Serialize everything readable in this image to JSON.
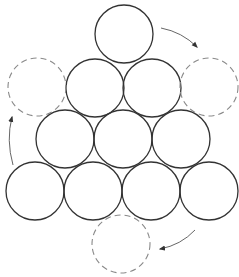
{
  "diagram": {
    "width": 239,
    "height": 277,
    "radius": 29,
    "colors": {
      "solid_stroke": "#333333",
      "dashed_stroke": "#8a8a8a",
      "arrow_stroke": "#555555",
      "background": "#ffffff"
    },
    "solid_circles": [
      {
        "id": "r1c1",
        "cx": 124,
        "cy": 34
      },
      {
        "id": "r2c1",
        "cx": 95,
        "cy": 88
      },
      {
        "id": "r2c2",
        "cx": 152,
        "cy": 88
      },
      {
        "id": "r3c1",
        "cx": 65,
        "cy": 139
      },
      {
        "id": "r3c2",
        "cx": 123,
        "cy": 139
      },
      {
        "id": "r3c3",
        "cx": 181,
        "cy": 139
      },
      {
        "id": "r4c1",
        "cx": 35,
        "cy": 191
      },
      {
        "id": "r4c2",
        "cx": 93,
        "cy": 191
      },
      {
        "id": "r4c3",
        "cx": 151,
        "cy": 191
      },
      {
        "id": "r4c4",
        "cx": 209,
        "cy": 191
      }
    ],
    "dashed_circles": [
      {
        "id": "target-left",
        "cx": 37,
        "cy": 87
      },
      {
        "id": "target-right",
        "cx": 209,
        "cy": 87
      },
      {
        "id": "target-bottom",
        "cx": 121,
        "cy": 244
      }
    ],
    "arrows": [
      {
        "id": "arrow-top-to-right",
        "path": "M161 28 Q182 32 197 47"
      },
      {
        "id": "arrow-bottom-left-to-left",
        "path": "M13 165 Q6 140 12 117"
      },
      {
        "id": "arrow-bottom-right-to-bottom",
        "path": "M195 230 Q181 245 160 249"
      }
    ]
  }
}
